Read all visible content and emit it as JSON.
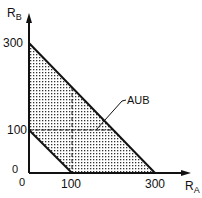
{
  "diagram": {
    "y_axis_label": "R",
    "y_axis_subscript": "B",
    "x_axis_label": "R",
    "x_axis_subscript": "A",
    "y_ticks": [
      "300",
      "100",
      "0"
    ],
    "x_ticks": [
      "0",
      "100",
      "300"
    ],
    "region_label": "AUB",
    "colors": {
      "line": "#111111",
      "dots": "#333333",
      "background": "#ffffff"
    }
  }
}
